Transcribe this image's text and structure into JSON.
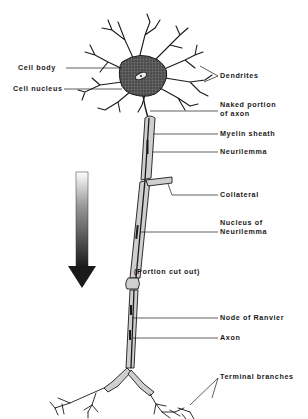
{
  "diagram": {
    "colors": {
      "ink": "#1a1a1a",
      "sheath_fill": "#c8c8c8",
      "background": "#ffffff"
    },
    "arrow": {
      "direction": "down",
      "meaning": "direction of impulse"
    },
    "labels": {
      "cell_body": "Cell body",
      "cell_nucleus": "Cell nucleus",
      "dendrites": "Dendrites",
      "naked_axon_line1": "Naked portion",
      "naked_axon_line2": "of axon",
      "myelin_sheath": "Myelin sheath",
      "neurilemma": "Neurilemma",
      "collateral": "Collateral",
      "nucleus_neurilemma_line1": "Nucleus of",
      "nucleus_neurilemma_line2": "Neurilemma",
      "portion_cut_out": "(Portion cut out)",
      "node_of_ranvier": "Node of Ranvier",
      "axon": "Axon",
      "terminal_branches": "Terminal branches"
    }
  }
}
